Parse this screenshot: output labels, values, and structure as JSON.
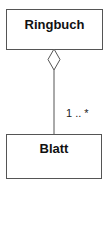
{
  "diagram": {
    "type": "uml-class-aggregation",
    "classes": [
      {
        "id": "ringbuch",
        "name": "Ringbuch"
      },
      {
        "id": "blatt",
        "name": "Blatt"
      }
    ],
    "association": {
      "from": "Ringbuch",
      "to": "Blatt",
      "kind": "aggregation",
      "aggregate_end_icon": "hollow-diamond-icon",
      "multiplicity": "1 .. *"
    },
    "colors": {
      "line": "#555555",
      "text": "#111111",
      "background": "#ffffff"
    }
  }
}
